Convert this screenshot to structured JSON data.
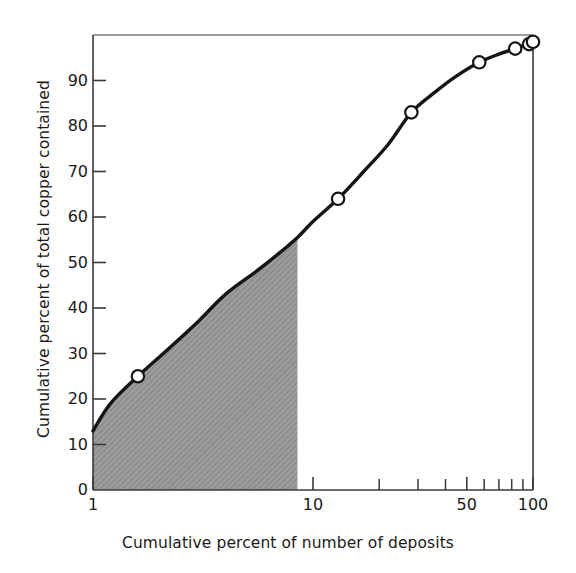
{
  "chart_data": {
    "type": "line",
    "title": "",
    "subtitle": "",
    "xlabel": "Cumulative percent of number of deposits",
    "ylabel": "Cumulative percent of total copper contained",
    "xscale": "log",
    "yscale": "linear",
    "xlim": [
      1,
      100
    ],
    "ylim": [
      0,
      100
    ],
    "grid": false,
    "legend": null,
    "x_tick_labels": [
      "1",
      "10",
      "50",
      "100"
    ],
    "x_tick_values": [
      1,
      10,
      50,
      100
    ],
    "x_minor_ticks": [
      20,
      30,
      40,
      60,
      70,
      80,
      90
    ],
    "y_tick_labels": [
      "0",
      "10",
      "20",
      "30",
      "40",
      "50",
      "60",
      "70",
      "80",
      "90"
    ],
    "y_tick_values": [
      0,
      10,
      20,
      30,
      40,
      50,
      60,
      70,
      80,
      90
    ],
    "series": [
      {
        "name": "Cumulative copper vs deposits",
        "marker": "open-circle",
        "x": [
          1.6,
          13,
          28,
          57,
          83,
          96,
          100
        ],
        "y": [
          25,
          64,
          83,
          94,
          97,
          98,
          98.5
        ]
      }
    ],
    "curve_x": [
      1,
      1.2,
      1.6,
      2.2,
      3,
      4,
      5.5,
      7,
      8.5,
      10,
      13,
      17,
      22,
      28,
      36,
      45,
      57,
      70,
      83,
      92,
      96,
      100
    ],
    "curve_y": [
      13,
      19,
      25,
      31,
      37,
      43,
      48,
      52,
      55.5,
      59,
      64,
      70,
      76,
      83,
      87.5,
      91,
      94,
      95.8,
      97,
      97.8,
      98,
      98.5
    ],
    "annotations": [
      {
        "name": "shaded-region",
        "kind": "filled-area",
        "x_from": 1,
        "x_to": 8.5,
        "y_from": 0,
        "y_to": "curve",
        "fill": "#9b9b9b",
        "hatch": "diagonal"
      }
    ],
    "colors": {
      "curve": "#151515",
      "marker_face": "#ffffff",
      "marker_edge": "#151515",
      "axis": "#3a3a3a",
      "shaded": "#9b9b9b",
      "text": "#1a1a1a",
      "background": "#ffffff"
    }
  }
}
